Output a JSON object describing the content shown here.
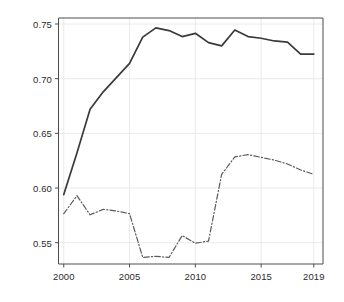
{
  "chart_data": {
    "type": "line",
    "title": "",
    "subtitle": "",
    "xlabel": "",
    "ylabel": "",
    "xlim": [
      1999.6,
      2019.7
    ],
    "ylim": [
      0.5305,
      0.7555
    ],
    "grid": true,
    "legend_position": "none",
    "x_ticks": [
      2000,
      2005,
      2010,
      2015,
      2019
    ],
    "x_tick_labels": [
      "2000",
      "2005",
      "2010",
      "2015",
      "2019"
    ],
    "y_ticks": [
      0.55,
      0.6,
      0.65,
      0.7,
      0.75
    ],
    "y_tick_labels": [
      "0.55",
      "0.60",
      "0.65",
      "0.70",
      "0.75"
    ],
    "x": [
      2000,
      2001,
      2002,
      2003,
      2004,
      2005,
      2006,
      2007,
      2008,
      2009,
      2010,
      2011,
      2012,
      2013,
      2014,
      2015,
      2016,
      2017,
      2018,
      2019
    ],
    "series": [
      {
        "name": "solid-series",
        "style": "solid",
        "color": "#3a3a3a",
        "width": 1.7,
        "values": [
          0.594,
          0.632,
          0.672,
          0.688,
          0.701,
          0.714,
          0.738,
          0.7465,
          0.744,
          0.7385,
          0.7415,
          0.733,
          0.73,
          0.7445,
          0.7385,
          0.737,
          0.7345,
          0.7335,
          0.7225,
          0.7225
        ]
      },
      {
        "name": "dash-dot-series",
        "style": "dash-dot",
        "color": "#5a5a5a",
        "width": 1.2,
        "values": [
          0.5765,
          0.593,
          0.5755,
          0.5805,
          0.579,
          0.5765,
          0.5365,
          0.5375,
          0.5365,
          0.5565,
          0.5495,
          0.5515,
          0.6125,
          0.6285,
          0.6305,
          0.628,
          0.6255,
          0.622,
          0.6165,
          0.6125
        ]
      }
    ],
    "colors": {
      "axis": "#4d4d4d",
      "grid": "#e8e8e8",
      "text": "#2b2b2b",
      "background": "#ffffff"
    }
  }
}
